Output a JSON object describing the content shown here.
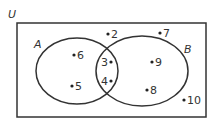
{
  "diagram": {
    "type": "venn",
    "universe_label": "U",
    "sets": [
      {
        "label": "A",
        "only": [
          "6",
          "5"
        ]
      },
      {
        "label": "B",
        "only": [
          "9",
          "8"
        ]
      }
    ],
    "intersection": [
      "3",
      "4"
    ],
    "outside": [
      "2",
      "7",
      "10"
    ],
    "colors": {
      "stroke": "#333333",
      "background": "#ffffff"
    }
  },
  "labels": {
    "U": "U",
    "A": "A",
    "B": "B",
    "e2": "2",
    "e3": "3",
    "e4": "4",
    "e5": "5",
    "e6": "6",
    "e7": "7",
    "e8": "8",
    "e9": "9",
    "e10": "10"
  }
}
